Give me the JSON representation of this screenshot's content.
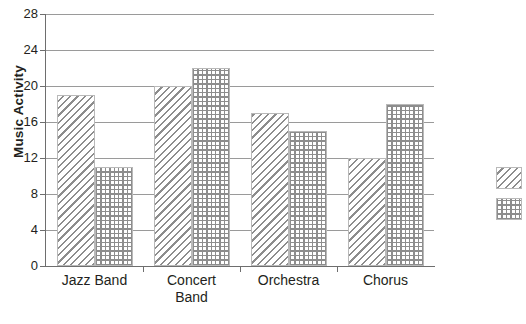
{
  "chart_data": {
    "type": "bar",
    "title": "",
    "subtitle": "",
    "xlabel": "",
    "ylabel": "Music Activity",
    "categories": [
      "Jazz Band",
      "Concert Band",
      "Orchestra",
      "Chorus"
    ],
    "category_lines": [
      [
        "Jazz Band"
      ],
      [
        "Concert",
        "Band"
      ],
      [
        "Orchestra"
      ],
      [
        "Chorus"
      ]
    ],
    "series": [
      {
        "name": "",
        "pattern": "diagonal-hatch",
        "values": [
          19,
          20,
          17,
          12
        ]
      },
      {
        "name": "",
        "pattern": "checkered-grid",
        "values": [
          11,
          22,
          15,
          18
        ]
      }
    ],
    "ylim": [
      0,
      28
    ],
    "yticks": [
      0,
      4,
      8,
      12,
      16,
      20,
      24,
      28
    ],
    "ytick_labels": [
      "0",
      "4",
      "8",
      "12",
      "16",
      "20",
      "24",
      "28"
    ],
    "grid": "horizontal",
    "legend_position": "right-outside-clipped",
    "legend_entries": [
      {
        "label": "",
        "pattern": "diagonal-hatch"
      },
      {
        "label": "",
        "pattern": "checkered-grid"
      }
    ],
    "colors": {
      "pattern_ink": "#8d8d8d",
      "gridline": "#9a9a9a",
      "axis": "#6e6e6e",
      "text": "#231f20",
      "background": "#ffffff"
    }
  },
  "caption": {
    "clipped_text": ""
  }
}
